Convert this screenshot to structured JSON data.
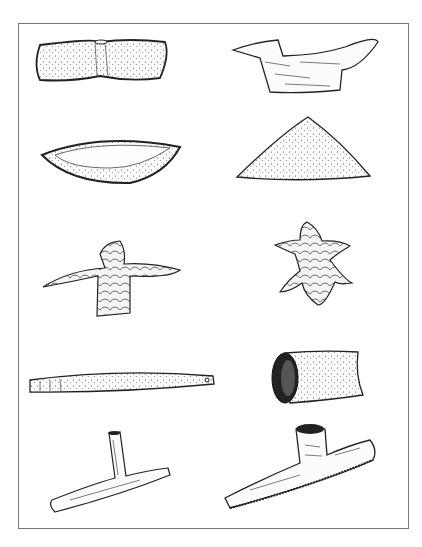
{
  "plate": {
    "border_color": "#777777",
    "background": "#ffffff",
    "artifacts": [
      {
        "id": "bar-bannerstone",
        "position": "row1-left",
        "texture": "stippled"
      },
      {
        "id": "bird-stone",
        "position": "row1-right",
        "texture": "wood-grain"
      },
      {
        "id": "boat-stone",
        "position": "row2-left",
        "texture": "stippled"
      },
      {
        "id": "cone-stone",
        "position": "row2-right",
        "texture": "stippled"
      },
      {
        "id": "bird-effigy-flint",
        "position": "row3-left",
        "texture": "flaked"
      },
      {
        "id": "human-effigy-flint",
        "position": "row3-right",
        "texture": "flaked"
      },
      {
        "id": "tapered-bar-stone",
        "position": "row4-left",
        "texture": "stippled"
      },
      {
        "id": "tube-pipe",
        "position": "row4-right",
        "texture": "stippled"
      },
      {
        "id": "t-pipe",
        "position": "row5-left",
        "texture": "wood-grain"
      },
      {
        "id": "platform-pipe",
        "position": "row5-right",
        "texture": "wood-grain"
      }
    ]
  }
}
